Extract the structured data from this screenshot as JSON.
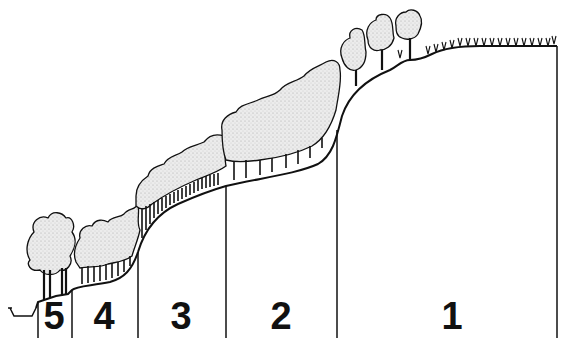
{
  "diagram": {
    "type": "vegetation-zonation-profile",
    "colors": {
      "line": "#111111",
      "canopy_fill": "#e4e4e4",
      "background": "#ffffff"
    },
    "zones": [
      {
        "label": "5",
        "x_center": 52
      },
      {
        "label": "4",
        "x_center": 104
      },
      {
        "label": "3",
        "x_center": 180
      },
      {
        "label": "2",
        "x_center": 281
      },
      {
        "label": "1",
        "x_center": 452
      }
    ],
    "boundaries_x": [
      38,
      72,
      138,
      226,
      337,
      557
    ]
  }
}
